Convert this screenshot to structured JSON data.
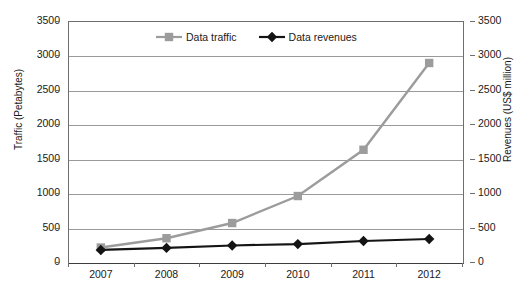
{
  "chart_data": {
    "type": "line",
    "title": "",
    "xlabel": "",
    "ylabel": "Traffic (Petabytes)",
    "y2label": "Revenues (US$ million)",
    "categories": [
      "2007",
      "2008",
      "2009",
      "2010",
      "2011",
      "2012"
    ],
    "ylim": [
      0,
      3500
    ],
    "y2lim": [
      0,
      3500
    ],
    "yticks": [
      0,
      500,
      1000,
      1500,
      2000,
      2500,
      3000,
      3500
    ],
    "y2ticks": [
      0,
      500,
      1000,
      1500,
      2000,
      2500,
      3000,
      3500
    ],
    "grid": "horizontal",
    "legend_position": "top-center-inside",
    "series": [
      {
        "name": "Data traffic",
        "axis": "left",
        "color": "#9c9c9c",
        "marker": "square",
        "values": [
          210,
          345,
          566,
          958,
          1630,
          2890
        ]
      },
      {
        "name": "Data revenues",
        "axis": "right",
        "color": "#141414",
        "marker": "diamond",
        "values": [
          175,
          205,
          240,
          260,
          305,
          334
        ]
      }
    ]
  },
  "axes": {
    "left_title": "Traffic (Petabytes)",
    "right_title": "Revenues (US$ million)",
    "left_ticks": [
      "3500",
      "3000",
      "2500",
      "2000",
      "1500",
      "1000",
      "500",
      "0"
    ],
    "right_ticks": [
      "3500",
      "3000",
      "2500",
      "2000",
      "1500",
      "1000",
      "500",
      "0"
    ],
    "x_ticks": [
      "2007",
      "2008",
      "2009",
      "2010",
      "2011",
      "2012"
    ]
  },
  "legend": {
    "items": [
      {
        "label": "Data traffic",
        "color": "#9c9c9c",
        "marker": "square"
      },
      {
        "label": "Data revenues",
        "color": "#141414",
        "marker": "diamond"
      }
    ]
  }
}
